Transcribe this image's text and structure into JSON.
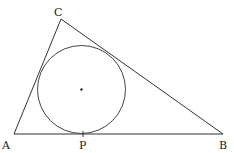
{
  "diagram": {
    "vertices": {
      "A": {
        "label": "A",
        "x": 14,
        "y": 134
      },
      "B": {
        "label": "B",
        "x": 223,
        "y": 134
      },
      "C": {
        "label": "C",
        "x": 61,
        "y": 19
      }
    },
    "incircle": {
      "cx": 81.5,
      "cy": 89.5,
      "r": 44,
      "center_dot": true
    },
    "tangent_point": {
      "label": "P",
      "x": 83,
      "y": 134
    },
    "labels": {
      "A": "A",
      "B": "B",
      "C": "C",
      "P": "P"
    },
    "colors": {
      "stroke": "#333333",
      "text": "#1a1a1a",
      "background": "#ffffff"
    }
  }
}
